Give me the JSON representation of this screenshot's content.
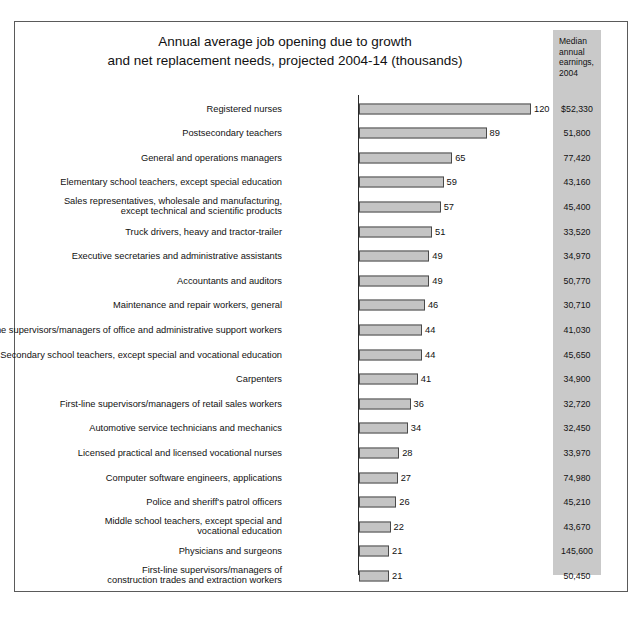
{
  "chart_data": {
    "type": "bar",
    "orientation": "horizontal",
    "title": "Annual average job opening due to growth and net replacement needs, projected 2004-14 (thousands)",
    "title_lines": [
      "Annual average job opening due to growth",
      "and net replacement needs, projected 2004-14 (thousands)"
    ],
    "xlabel": "",
    "ylabel": "",
    "xlim": [
      0,
      120
    ],
    "grid": false,
    "legend": null,
    "value_unit": "thousands",
    "secondary_column_header": "Median annual earnings, 2004",
    "secondary_column_header_lines": [
      "Median",
      "annual",
      "earnings,",
      "2004"
    ],
    "categories": [
      "Registered nurses",
      "Postsecondary teachers",
      "General and operations managers",
      "Elementary school teachers, except special education",
      "Sales representatives, wholesale and manufacturing,\nexcept technical and scientific products",
      "Truck drivers, heavy and tractor-trailer",
      "Executive secretaries and administrative assistants",
      "Accountants and auditors",
      "Maintenance and repair workers, general",
      "First-line supervisors/managers of office and administrative support workers",
      "Secondary school teachers, except special and vocational education",
      "Carpenters",
      "First-line supervisors/managers of retail sales workers",
      "Automotive service technicians and mechanics",
      "Licensed practical and licensed vocational nurses",
      "Computer software engineers, applications",
      "Police and sheriff's patrol officers",
      "Middle school teachers, except special and\nvocational education",
      "Physicians and surgeons",
      "First-line supervisors/managers of\nconstruction trades and extraction workers"
    ],
    "values": [
      120,
      89,
      65,
      59,
      57,
      51,
      49,
      49,
      46,
      44,
      44,
      41,
      36,
      34,
      28,
      27,
      26,
      22,
      21,
      21
    ],
    "value_labels": [
      "120",
      "89",
      "65",
      "59",
      "57",
      "51",
      "49",
      "49",
      "46",
      "44",
      "44",
      "41",
      "36",
      "34",
      "28",
      "27",
      "26",
      "22",
      "21",
      "21"
    ],
    "median_annual_earnings_2004": [
      "$52,330",
      "51,800",
      "77,420",
      "43,160",
      "45,400",
      "33,520",
      "34,970",
      "50,770",
      "30,710",
      "41,030",
      "45,650",
      "34,900",
      "32,720",
      "32,450",
      "33,970",
      "74,980",
      "45,210",
      "43,670",
      "145,600",
      "50,450"
    ],
    "colors": {
      "bar_fill": "#c4c4c4",
      "bar_edge": "#4a4a4a",
      "earnings_column_bg": "#c9c9c9",
      "frame_border": "#5a5a5a",
      "text": "#111111"
    }
  }
}
